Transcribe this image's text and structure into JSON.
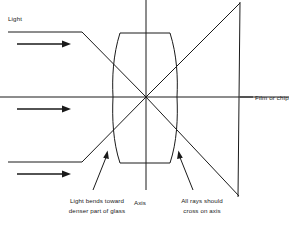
{
  "figure": {
    "type": "optical-ray-diagram",
    "background_color": "#ffffff",
    "line_color": "#1a1a1a"
  },
  "labels": {
    "light": "Light",
    "film_or_chip": "Film or chip",
    "axis": "Axis",
    "callout_left_line1": "Light bends toward",
    "callout_left_line2": "denser part of glass",
    "callout_right_line1": "All rays should",
    "callout_right_line2": "cross on axis"
  },
  "geometry": {
    "focus_point": {
      "x": 146,
      "y": 97
    },
    "lens": {
      "top_flat_y": 33,
      "bottom_flat_y": 163,
      "top_flat_x_start": 120,
      "top_flat_x_end": 170,
      "left_edge_x": 113,
      "right_edge_x": 177
    },
    "film_plane": {
      "x_top": 240,
      "y_top": 2,
      "x_bottom": 238,
      "y_bottom": 197
    },
    "incoming_rays_y": [
      32,
      97,
      162
    ],
    "direction_arrows_y": [
      44,
      109,
      174
    ]
  }
}
